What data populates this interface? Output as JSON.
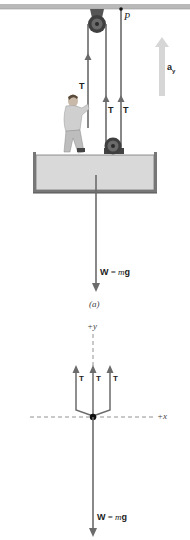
{
  "figure": {
    "part_a": {
      "point_label": "P",
      "accel_label": "a",
      "accel_subscript": "y",
      "tension_labels": [
        "T",
        "T",
        "T"
      ],
      "weight_label_bold": "W",
      "weight_label_eq": " = ",
      "weight_label_m": "m",
      "weight_label_g": "g",
      "caption": "(a)"
    },
    "free_body": {
      "y_axis_label": "+y",
      "x_axis_label": "+x",
      "tension_labels": [
        "T",
        "T",
        "T"
      ],
      "weight_label_bold": "W",
      "weight_label_eq": " = ",
      "weight_label_m": "m",
      "weight_label_g": "g"
    }
  },
  "colors": {
    "ceiling": "#b9b9b9",
    "rope": "#555555",
    "arrow": "#6b6b6b",
    "accel_arrow": "#d6d6d6",
    "platform_fill": "#d9d9d9",
    "platform_edge": "#666666",
    "pulley": "#4a4a4a"
  }
}
